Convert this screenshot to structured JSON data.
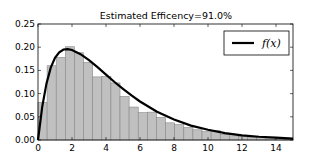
{
  "chart_data": {
    "type": "bar",
    "title": "Estimated Efficency=91.0%",
    "xlabel": "",
    "ylabel": "",
    "xlim": [
      0,
      15
    ],
    "ylim": [
      0,
      0.25
    ],
    "grid": false,
    "legend_position": "upper right",
    "x_ticks": [
      0,
      2,
      4,
      6,
      8,
      10,
      12,
      14
    ],
    "x_tick_labels": [
      "0",
      "2",
      "4",
      "6",
      "8",
      "10",
      "12",
      "14"
    ],
    "y_ticks": [
      0.0,
      0.05,
      0.1,
      0.15,
      0.2,
      0.25
    ],
    "y_tick_labels": [
      "0.00",
      "0.05",
      "0.10",
      "0.15",
      "0.20",
      "0.25"
    ],
    "histogram": {
      "bin_width": 0.536,
      "bin_start": 0,
      "color": "#c0c0c0",
      "edgecolor": "#888888",
      "values": [
        0.081,
        0.16,
        0.178,
        0.201,
        0.188,
        0.167,
        0.136,
        0.137,
        0.123,
        0.094,
        0.071,
        0.059,
        0.06,
        0.049,
        0.037,
        0.033,
        0.027,
        0.022,
        0.018,
        0.02,
        0.012,
        0.009,
        0.008,
        0.006,
        0.005,
        0.004,
        0.003,
        0.002
      ]
    },
    "series": [
      {
        "name": "f(x)",
        "type": "line",
        "color": "#000000",
        "x": [
          0,
          0.25,
          0.5,
          0.75,
          1,
          1.25,
          1.5,
          1.75,
          2,
          2.5,
          3,
          3.5,
          4,
          4.5,
          5,
          5.5,
          6,
          7,
          8,
          9,
          10,
          11,
          12,
          13,
          14,
          15
        ],
        "y": [
          0.0,
          0.072,
          0.122,
          0.156,
          0.177,
          0.189,
          0.195,
          0.196,
          0.194,
          0.185,
          0.172,
          0.157,
          0.141,
          0.125,
          0.11,
          0.096,
          0.083,
          0.061,
          0.044,
          0.031,
          0.022,
          0.015,
          0.01,
          0.007,
          0.005,
          0.003
        ]
      }
    ],
    "legend": [
      {
        "label": "f(x)",
        "style": "line",
        "color": "#000000"
      }
    ]
  }
}
